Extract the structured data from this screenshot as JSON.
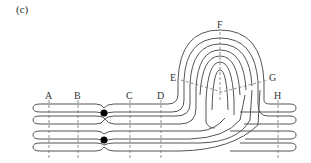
{
  "panel_label": "(c)",
  "labels": {
    "A": "A",
    "B": "B",
    "C": "C",
    "D": "D",
    "E": "E",
    "F": "F",
    "G": "G",
    "H": "H"
  },
  "colors": {
    "stroke": "#555555",
    "dash": "#777777",
    "centromere": "#000000"
  }
}
